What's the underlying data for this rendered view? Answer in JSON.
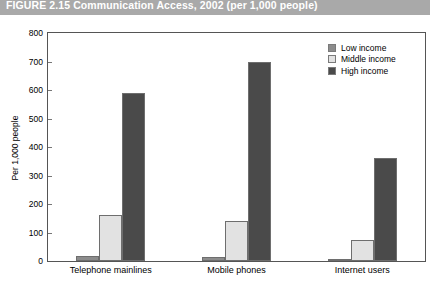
{
  "title": {
    "figure_number": "FIGURE 2.15",
    "text": "Communication Access, 2002 (per 1,000 people)",
    "full": "FIGURE 2.15  Communication Access, 2002 (per 1,000 people)"
  },
  "colors": {
    "title_bar": "#a9a9a9",
    "title_text": "#ffffff",
    "low_income": "#8c8c8c",
    "middle_income": "#e2e2e2",
    "high_income": "#4a4a4a",
    "axis": "#555555",
    "background": "#ffffff"
  },
  "chart_data": {
    "type": "bar",
    "title": "FIGURE 2.15  Communication Access, 2002 (per 1,000 people)",
    "xlabel": "",
    "ylabel": "Per 1,000 people",
    "ylim": [
      0,
      800
    ],
    "yticks": [
      0,
      100,
      200,
      300,
      400,
      500,
      600,
      700,
      800
    ],
    "ytick_labels": [
      "0",
      "100",
      "200",
      "300",
      "400",
      "500",
      "600",
      "700",
      "800"
    ],
    "grid": false,
    "legend_position": "top-right",
    "categories": [
      "Telephone mainlines",
      "Mobile phones",
      "Internet users"
    ],
    "series": [
      {
        "name": "Low income",
        "color": "#8c8c8c",
        "values": [
          18,
          14,
          7
        ]
      },
      {
        "name": "Middle income",
        "color": "#e2e2e2",
        "values": [
          162,
          140,
          75
        ]
      },
      {
        "name": "High income",
        "color": "#4a4a4a",
        "values": [
          588,
          698,
          362
        ]
      }
    ]
  }
}
